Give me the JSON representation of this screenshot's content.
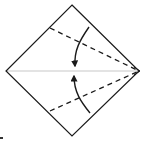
{
  "diagram": {
    "type": "origami-fold-diagram",
    "shape": "square-diamond",
    "colors": {
      "outline": "#1a1a1a",
      "center_crease": "#c8c8c8",
      "dashed_fold": "#1a1a1a",
      "arrow": "#1a1a1a",
      "background": "#ffffff"
    },
    "vertices": {
      "top": [
        72,
        5
      ],
      "left": [
        6,
        71
      ],
      "right": [
        139,
        71
      ],
      "bottom": [
        72,
        136
      ]
    },
    "folds": [
      {
        "name": "upper-valley-fold",
        "from": [
          50,
          28
        ],
        "to": [
          139,
          71
        ],
        "style": "dashed"
      },
      {
        "name": "lower-valley-fold",
        "from": [
          50,
          113
        ],
        "to": [
          139,
          71
        ],
        "style": "dashed"
      }
    ],
    "arrows": [
      {
        "name": "fold-down-arrow",
        "direction": "down"
      },
      {
        "name": "fold-up-arrow",
        "direction": "up"
      }
    ]
  }
}
